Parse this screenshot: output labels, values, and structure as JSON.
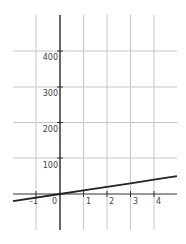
{
  "chart_data": {
    "type": "line",
    "title": "",
    "xlabel": "",
    "ylabel": "",
    "xlim": [
      -2,
      5
    ],
    "ylim": [
      -100,
      500
    ],
    "grid": true,
    "x_ticks": [
      "-1",
      "0",
      "1",
      "2",
      "3",
      "4"
    ],
    "y_ticks": [
      "100",
      "200",
      "300",
      "400"
    ],
    "series": [
      {
        "name": "line",
        "x": [
          -2,
          0,
          1,
          2,
          3,
          4,
          5
        ],
        "values": [
          -20,
          0,
          10,
          20,
          30,
          40,
          50
        ]
      }
    ]
  },
  "colors": {
    "grid": "#c8c8c8",
    "axis": "#333333",
    "line": "#222222"
  }
}
